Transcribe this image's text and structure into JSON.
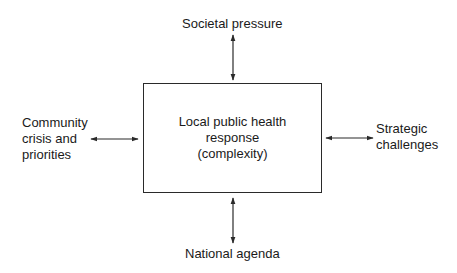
{
  "diagram": {
    "center": {
      "lines": [
        "Local public health",
        "response",
        "(complexity)"
      ]
    },
    "top": {
      "label": "Societal pressure"
    },
    "bottom": {
      "label": "National agenda"
    },
    "left": {
      "lines": [
        "Community",
        "crisis and",
        "priorities"
      ]
    },
    "right": {
      "lines": [
        "Strategic",
        "challenges"
      ]
    },
    "connections": [
      {
        "from": "Societal pressure",
        "to": "Local public health response (complexity)",
        "type": "bidirectional"
      },
      {
        "from": "National agenda",
        "to": "Local public health response (complexity)",
        "type": "bidirectional"
      },
      {
        "from": "Community crisis and priorities",
        "to": "Local public health response (complexity)",
        "type": "bidirectional"
      },
      {
        "from": "Strategic challenges",
        "to": "Local public health response (complexity)",
        "type": "bidirectional"
      }
    ],
    "colors": {
      "line": "#2a2a2a",
      "text": "#1a1a1a",
      "background": "#ffffff"
    }
  }
}
